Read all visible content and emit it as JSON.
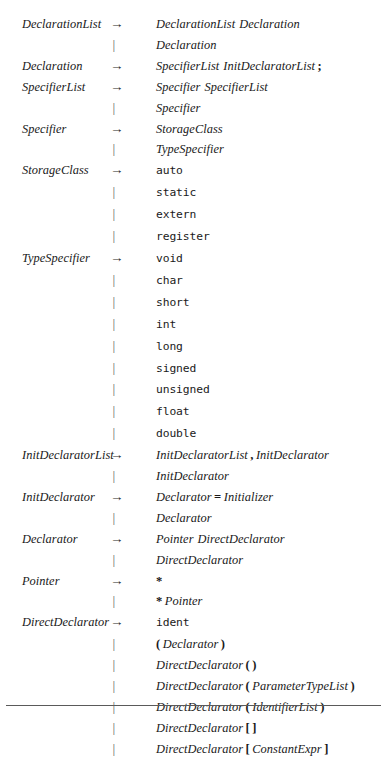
{
  "figure": {
    "arrow_symbol": "→",
    "alternation_symbol": "|",
    "has_bottom_rule": true,
    "background_color": "#ffffff",
    "text_color": "#1a1a1a",
    "rule_color": "#5a5a5a"
  },
  "productions": [
    {
      "lhs": "DeclarationList",
      "op": "→",
      "rhs": [
        {
          "t": "nt",
          "v": "DeclarationList"
        },
        {
          "t": "gap"
        },
        {
          "t": "nt",
          "v": "Declaration"
        }
      ]
    },
    {
      "lhs": "",
      "op": "|",
      "rhs": [
        {
          "t": "nt",
          "v": "Declaration"
        }
      ]
    },
    {
      "lhs": "Declaration",
      "op": "→",
      "rhs": [
        {
          "t": "nt",
          "v": "SpecifierList"
        },
        {
          "t": "gap"
        },
        {
          "t": "nt",
          "v": "InitDeclaratorList"
        },
        {
          "t": "pn",
          "v": ";",
          "sp": "l"
        }
      ]
    },
    {
      "lhs": "SpecifierList",
      "op": "→",
      "rhs": [
        {
          "t": "nt",
          "v": "Specifier"
        },
        {
          "t": "gap"
        },
        {
          "t": "nt",
          "v": "SpecifierList"
        }
      ]
    },
    {
      "lhs": "",
      "op": "|",
      "rhs": [
        {
          "t": "nt",
          "v": "Specifier"
        }
      ]
    },
    {
      "lhs": "Specifier",
      "op": "→",
      "rhs": [
        {
          "t": "nt",
          "v": "StorageClass"
        }
      ]
    },
    {
      "lhs": "",
      "op": "|",
      "rhs": [
        {
          "t": "nt",
          "v": "TypeSpecifier"
        }
      ]
    },
    {
      "lhs": "StorageClass",
      "op": "→",
      "rhs": [
        {
          "t": "kw",
          "v": "auto"
        }
      ]
    },
    {
      "lhs": "",
      "op": "|",
      "rhs": [
        {
          "t": "kw",
          "v": "static"
        }
      ]
    },
    {
      "lhs": "",
      "op": "|",
      "rhs": [
        {
          "t": "kw",
          "v": "extern"
        }
      ]
    },
    {
      "lhs": "",
      "op": "|",
      "rhs": [
        {
          "t": "kw",
          "v": "register"
        }
      ]
    },
    {
      "lhs": "TypeSpecifier",
      "op": "→",
      "rhs": [
        {
          "t": "kw",
          "v": "void"
        }
      ]
    },
    {
      "lhs": "",
      "op": "|",
      "rhs": [
        {
          "t": "kw",
          "v": "char"
        }
      ]
    },
    {
      "lhs": "",
      "op": "|",
      "rhs": [
        {
          "t": "kw",
          "v": "short"
        }
      ]
    },
    {
      "lhs": "",
      "op": "|",
      "rhs": [
        {
          "t": "kw",
          "v": "int"
        }
      ]
    },
    {
      "lhs": "",
      "op": "|",
      "rhs": [
        {
          "t": "kw",
          "v": "long"
        }
      ]
    },
    {
      "lhs": "",
      "op": "|",
      "rhs": [
        {
          "t": "kw",
          "v": "signed"
        }
      ]
    },
    {
      "lhs": "",
      "op": "|",
      "rhs": [
        {
          "t": "kw",
          "v": "unsigned"
        }
      ]
    },
    {
      "lhs": "",
      "op": "|",
      "rhs": [
        {
          "t": "kw",
          "v": "float"
        }
      ]
    },
    {
      "lhs": "",
      "op": "|",
      "rhs": [
        {
          "t": "kw",
          "v": "double"
        }
      ]
    },
    {
      "lhs": "InitDeclaratorList",
      "op": "→",
      "rhs": [
        {
          "t": "nt",
          "v": "InitDeclaratorList"
        },
        {
          "t": "pn",
          "v": ",",
          "sp": "lr"
        },
        {
          "t": "nt",
          "v": "InitDeclarator"
        }
      ]
    },
    {
      "lhs": "",
      "op": "|",
      "rhs": [
        {
          "t": "nt",
          "v": "InitDeclarator"
        }
      ]
    },
    {
      "lhs": "InitDeclarator",
      "op": "→",
      "rhs": [
        {
          "t": "nt",
          "v": "Declarator"
        },
        {
          "t": "pn",
          "v": "=",
          "sp": "lr"
        },
        {
          "t": "nt",
          "v": "Initializer"
        }
      ]
    },
    {
      "lhs": "",
      "op": "|",
      "rhs": [
        {
          "t": "nt",
          "v": "Declarator"
        }
      ]
    },
    {
      "lhs": "Declarator",
      "op": "→",
      "rhs": [
        {
          "t": "nt",
          "v": "Pointer"
        },
        {
          "t": "gap"
        },
        {
          "t": "nt",
          "v": "DirectDeclarator"
        }
      ]
    },
    {
      "lhs": "",
      "op": "|",
      "rhs": [
        {
          "t": "nt",
          "v": "DirectDeclarator"
        }
      ]
    },
    {
      "lhs": "Pointer",
      "op": "→",
      "rhs": [
        {
          "t": "pn",
          "v": "*"
        }
      ]
    },
    {
      "lhs": "",
      "op": "|",
      "rhs": [
        {
          "t": "pn",
          "v": "*",
          "sp": "r"
        },
        {
          "t": "nt",
          "v": "Pointer"
        }
      ]
    },
    {
      "lhs": "DirectDeclarator",
      "op": "→",
      "rhs": [
        {
          "t": "kw",
          "v": "ident"
        }
      ]
    },
    {
      "lhs": "",
      "op": "|",
      "rhs": [
        {
          "t": "pn",
          "v": "(",
          "sp": "r"
        },
        {
          "t": "nt",
          "v": "Declarator"
        },
        {
          "t": "pn",
          "v": ")",
          "sp": "l"
        }
      ]
    },
    {
      "lhs": "",
      "op": "|",
      "rhs": [
        {
          "t": "nt",
          "v": "DirectDeclarator"
        },
        {
          "t": "pn",
          "v": "(",
          "sp": "lr"
        },
        {
          "t": "pn",
          "v": ")"
        }
      ]
    },
    {
      "lhs": "",
      "op": "|",
      "rhs": [
        {
          "t": "nt",
          "v": "DirectDeclarator"
        },
        {
          "t": "pn",
          "v": "(",
          "sp": "lr"
        },
        {
          "t": "nt",
          "v": "ParameterTypeList"
        },
        {
          "t": "pn",
          "v": ")",
          "sp": "l"
        }
      ]
    },
    {
      "lhs": "",
      "op": "|",
      "rhs": [
        {
          "t": "nt",
          "v": "DirectDeclarator"
        },
        {
          "t": "pn",
          "v": "(",
          "sp": "lr"
        },
        {
          "t": "nt",
          "v": "IdentifierList"
        },
        {
          "t": "pn",
          "v": ")",
          "sp": "l"
        }
      ]
    },
    {
      "lhs": "",
      "op": "|",
      "rhs": [
        {
          "t": "nt",
          "v": "DirectDeclarator"
        },
        {
          "t": "pn",
          "v": "[",
          "sp": "lr"
        },
        {
          "t": "pn",
          "v": "]"
        }
      ]
    },
    {
      "lhs": "",
      "op": "|",
      "rhs": [
        {
          "t": "nt",
          "v": "DirectDeclarator"
        },
        {
          "t": "pn",
          "v": "[",
          "sp": "lr"
        },
        {
          "t": "nt",
          "v": "ConstantExpr"
        },
        {
          "t": "pn",
          "v": "]",
          "sp": "l"
        }
      ]
    }
  ]
}
